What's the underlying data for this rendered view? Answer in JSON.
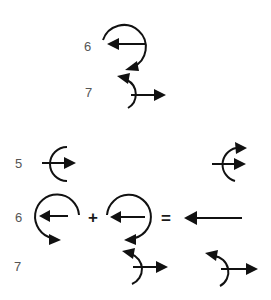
{
  "figure": {
    "top_group": {
      "rows": [
        {
          "label": "6",
          "glyph": "counterclockwise-curl-with-left-arrow"
        },
        {
          "label": "7",
          "glyph": "left-opening-arc-with-right-arrow"
        }
      ]
    },
    "bottom_group": {
      "rows": [
        {
          "label": "5",
          "left_glyph": "left-opening-arc-with-right-arrow",
          "right_glyph": "arc-with-two-right-arrows"
        },
        {
          "label": "6",
          "operator_plus": "+",
          "operator_equals": "=",
          "result": "long-left-arrow"
        },
        {
          "label": "7",
          "left_glyph": "arc-with-right-arrow",
          "right_glyph": "arc-with-right-arrow"
        }
      ]
    },
    "colors": {
      "ink": "#111111",
      "label": "#555555",
      "background": "#ffffff"
    }
  }
}
